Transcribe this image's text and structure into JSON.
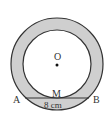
{
  "diagram": {
    "type": "concentric-circles-annulus",
    "colors": {
      "annulus_fill": "#cfcfcf",
      "inner_fill": "#ffffff",
      "stroke": "#333333",
      "background": "#ffffff"
    },
    "center": {
      "label": "O",
      "x": 57,
      "y": 64
    },
    "outer_circle": {
      "r": 46
    },
    "inner_circle": {
      "r": 34
    },
    "chord": {
      "start_label": "A",
      "end_label": "B",
      "midpoint_label": "M",
      "length_label": "8 cm",
      "y": 98
    }
  }
}
